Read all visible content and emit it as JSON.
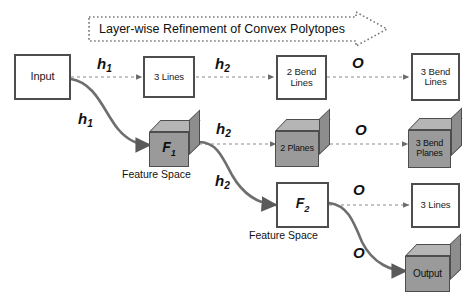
{
  "figure": {
    "banner": {
      "text": "Layer-wise Refinement of Convex Polytopes",
      "shape": "dotted-right-arrow"
    },
    "colors": {
      "stroke": "#4d4d4d",
      "cube_front": "#9a9a9a",
      "cube_top": "#b5b5b5",
      "cube_side": "#8d8d8d",
      "text": "#111111",
      "background": "#ffffff"
    },
    "rows": [
      {
        "name": "row-polytope-lines",
        "nodes": [
          {
            "id": "input",
            "label": "Input",
            "shape": "square"
          },
          {
            "id": "three-lines-1",
            "label": "3 Lines",
            "shape": "square"
          },
          {
            "id": "two-bend-lines",
            "label": "2 Bend\nLines",
            "shape": "square"
          },
          {
            "id": "three-bend-lines",
            "label": "3 Bend\nLines",
            "shape": "square"
          }
        ]
      },
      {
        "name": "row-feature-space-1",
        "nodes": [
          {
            "id": "f1",
            "label": "F1",
            "shape": "cube",
            "caption": "Feature Space"
          },
          {
            "id": "two-planes",
            "label": "2 Planes",
            "shape": "cube"
          },
          {
            "id": "three-bend-planes",
            "label": "3 Bend\nPlanes",
            "shape": "cube"
          }
        ]
      },
      {
        "name": "row-feature-space-2",
        "nodes": [
          {
            "id": "f2",
            "label": "F2",
            "shape": "square",
            "caption": "Feature Space"
          },
          {
            "id": "three-lines-2",
            "label": "3 Lines",
            "shape": "square"
          }
        ]
      },
      {
        "name": "row-output",
        "nodes": [
          {
            "id": "output",
            "label": "Output",
            "shape": "cube"
          }
        ]
      }
    ],
    "node_labels": {
      "input": "Input",
      "three_lines_1": "3 Lines",
      "two_bend_lines_a": "2 Bend",
      "two_bend_lines_b": "Lines",
      "three_bend_lines_a": "3 Bend",
      "three_bend_lines_b": "Lines",
      "f1": "F",
      "f1_sub": "1",
      "two_planes": "2 Planes",
      "three_bend_planes_a": "3 Bend",
      "three_bend_planes_b": "Planes",
      "f2": "F",
      "f2_sub": "2",
      "three_lines_2": "3 Lines",
      "output": "Output",
      "feature_space_1": "Feature Space",
      "feature_space_2": "Feature Space"
    },
    "edge_labels": {
      "h1_top": "h",
      "h1_top_sub": "1",
      "h2_top": "h",
      "h2_top_sub": "2",
      "o_top": "O",
      "h1_diag": "h",
      "h1_diag_sub": "1",
      "h2_mid": "h",
      "h2_mid_sub": "2",
      "o_mid": "O",
      "h2_diag": "h",
      "h2_diag_sub": "2",
      "o_low": "O",
      "o_out": "O"
    },
    "edges": [
      {
        "from": "input",
        "to": "three-lines-1",
        "label": "h1",
        "style": "dashed"
      },
      {
        "from": "three-lines-1",
        "to": "two-bend-lines",
        "label": "h2",
        "style": "dashed"
      },
      {
        "from": "two-bend-lines",
        "to": "three-bend-lines",
        "label": "O",
        "style": "dashed"
      },
      {
        "from": "input",
        "to": "f1",
        "label": "h1",
        "style": "solid-curve"
      },
      {
        "from": "f1",
        "to": "two-planes",
        "label": "h2",
        "style": "dashed"
      },
      {
        "from": "two-planes",
        "to": "three-bend-planes",
        "label": "O",
        "style": "dashed"
      },
      {
        "from": "f1",
        "to": "f2",
        "label": "h2",
        "style": "solid-curve"
      },
      {
        "from": "f2",
        "to": "three-lines-2",
        "label": "O",
        "style": "dashed"
      },
      {
        "from": "f2",
        "to": "output",
        "label": "O",
        "style": "solid-curve"
      }
    ]
  }
}
